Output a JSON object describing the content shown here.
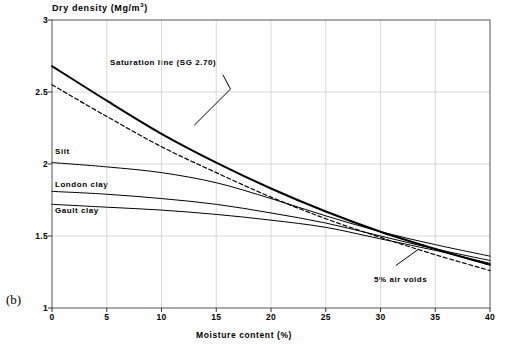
{
  "figure": {
    "panel_letter": "(b)"
  },
  "chart_data": {
    "type": "line",
    "title": "",
    "ylabel": "Dry density (Mg/m",
    "ylabel_sup": "3",
    "ylabel_tail": ")",
    "ylabel_full": "Dry density (Mg/m³)",
    "xlabel": "Moisture content (%)",
    "xlim": [
      0,
      40
    ],
    "ylim": [
      1,
      3
    ],
    "xticks": [
      0,
      5,
      10,
      15,
      20,
      25,
      30,
      35,
      40
    ],
    "xticklabels": [
      "0",
      "5",
      "10",
      "15",
      "20",
      "25",
      "30",
      "35",
      "40"
    ],
    "yticks": [
      1,
      1.5,
      2,
      2.5,
      3
    ],
    "yticklabels": [
      "1",
      "1.5",
      "2",
      "2.5",
      "3"
    ],
    "grid": true,
    "grid_color": "#c8c8c8",
    "legend": "none",
    "annotations": [
      {
        "name": "saturation-line-annotation",
        "text": "Saturation line (SG 2.70)",
        "points_to_x": 13.0,
        "points_to_y": 2.27
      },
      {
        "name": "air-voids-annotation",
        "text": "5% air voids",
        "points_to_x": 33.5,
        "points_to_y": 1.41
      }
    ],
    "series": [
      {
        "name": "Saturation line (SG 2.70)",
        "style": "solid",
        "width": 2.0,
        "color": "#000000",
        "inline_label": "",
        "x": [
          0,
          5,
          10,
          15,
          20,
          25,
          30,
          35,
          40
        ],
        "y": [
          2.68,
          2.44,
          2.21,
          2.01,
          1.83,
          1.67,
          1.53,
          1.41,
          1.3
        ]
      },
      {
        "name": "5% air voids",
        "style": "dashed",
        "width": 1.2,
        "color": "#000000",
        "inline_label": "5% air voids",
        "x": [
          0,
          5,
          10,
          15,
          20,
          25,
          30,
          35,
          40
        ],
        "y": [
          2.55,
          2.33,
          2.12,
          1.94,
          1.77,
          1.62,
          1.49,
          1.37,
          1.26
        ]
      },
      {
        "name": "Silt",
        "style": "solid",
        "width": 1.0,
        "color": "#000000",
        "inline_label": "Silt",
        "x": [
          0,
          5,
          10,
          15,
          20,
          25,
          30,
          35,
          40
        ],
        "y": [
          2.01,
          1.98,
          1.94,
          1.87,
          1.76,
          1.64,
          1.53,
          1.44,
          1.36
        ]
      },
      {
        "name": "London clay",
        "style": "solid",
        "width": 1.0,
        "color": "#000000",
        "inline_label": "London clay",
        "x": [
          0,
          5,
          10,
          15,
          20,
          25,
          30,
          35,
          40
        ],
        "y": [
          1.81,
          1.79,
          1.76,
          1.72,
          1.66,
          1.59,
          1.5,
          1.41,
          1.33
        ]
      },
      {
        "name": "Gault clay",
        "style": "solid",
        "width": 1.0,
        "color": "#000000",
        "inline_label": "Gault clay",
        "x": [
          0,
          5,
          10,
          15,
          20,
          25,
          30,
          35,
          40
        ],
        "y": [
          1.72,
          1.7,
          1.68,
          1.65,
          1.61,
          1.56,
          1.48,
          1.4,
          1.31
        ]
      }
    ]
  }
}
